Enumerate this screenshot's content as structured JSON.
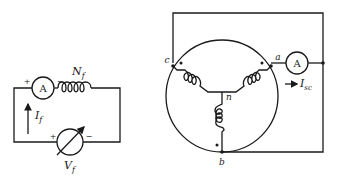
{
  "field_circuit": {
    "ammeter_label": "A",
    "plus_top": "+",
    "minus_top": "−",
    "winding_label": "N",
    "winding_sub": "f",
    "current_label": "I",
    "current_sub": "f",
    "plus_bottom": "+",
    "minus_bottom": "−",
    "source_label": "V",
    "source_sub": "f"
  },
  "armature_circuit": {
    "terminal_a": "a",
    "terminal_b": "b",
    "terminal_c": "c",
    "neutral": "n",
    "ammeter_label": "A",
    "current_label": "I",
    "current_sub": "sc"
  }
}
